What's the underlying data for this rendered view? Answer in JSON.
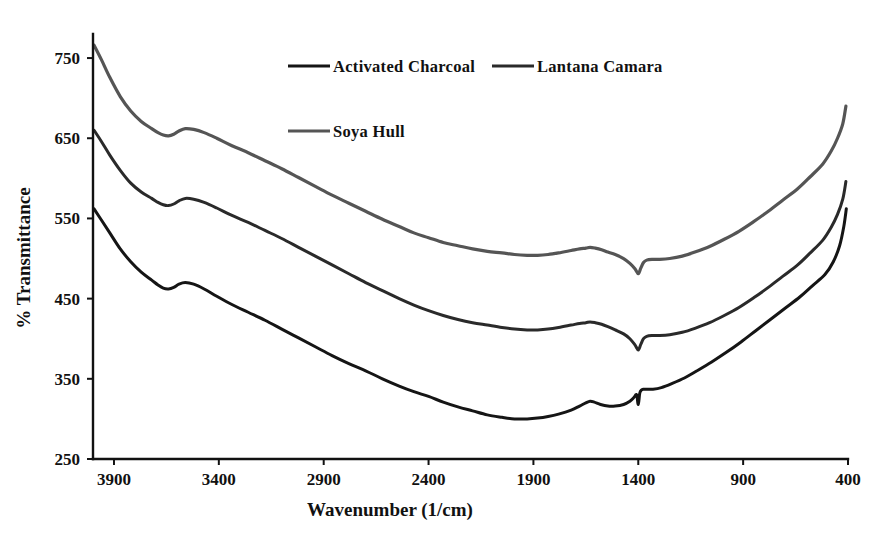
{
  "figure": {
    "width": 895,
    "height": 534,
    "background": "#ffffff"
  },
  "chart_data": {
    "type": "line",
    "title": "",
    "xlabel": "Wavenumber (1/cm)",
    "ylabel": "% Transmittance",
    "xlim": [
      4000,
      400
    ],
    "ylim": [
      250,
      780
    ],
    "x_ticks": [
      3900,
      3400,
      2900,
      2400,
      1900,
      1400,
      900,
      400
    ],
    "y_ticks": [
      250,
      350,
      450,
      550,
      650,
      750
    ],
    "x_reversed": true,
    "grid": false,
    "legend_position": "top-center",
    "series": [
      {
        "name": "Activated Charcoal",
        "color": "#151515",
        "width": 3.0,
        "x": [
          3995,
          3960,
          3920,
          3870,
          3820,
          3770,
          3720,
          3690,
          3665,
          3640,
          3615,
          3590,
          3560,
          3520,
          3470,
          3410,
          3340,
          3260,
          3180,
          3100,
          3020,
          2940,
          2860,
          2780,
          2700,
          2620,
          2540,
          2470,
          2400,
          2330,
          2260,
          2190,
          2120,
          2050,
          1990,
          1930,
          1880,
          1830,
          1780,
          1720,
          1680,
          1650,
          1630,
          1610,
          1580,
          1545,
          1510,
          1470,
          1440,
          1420,
          1408,
          1400,
          1393,
          1385,
          1375,
          1360,
          1330,
          1290,
          1240,
          1180,
          1120,
          1050,
          980,
          910,
          840,
          770,
          700,
          630,
          570,
          510,
          470,
          440,
          420,
          408
        ],
        "y": [
          562,
          548,
          532,
          512,
          496,
          483,
          473,
          467,
          463,
          462,
          464,
          468,
          470,
          468,
          462,
          453,
          443,
          433,
          423,
          412,
          401,
          390,
          379,
          369,
          360,
          350,
          341,
          334,
          328,
          321,
          315,
          310,
          305,
          302,
          300,
          300,
          301,
          303,
          306,
          311,
          316,
          320,
          322,
          321,
          318,
          316,
          316,
          318,
          322,
          327,
          330,
          318,
          332,
          336,
          337,
          337,
          337,
          339,
          344,
          351,
          360,
          371,
          383,
          396,
          410,
          424,
          438,
          452,
          466,
          480,
          496,
          516,
          540,
          562
        ]
      },
      {
        "name": "Lantana Camara",
        "color": "#2a2a2a",
        "width": 3.0,
        "x": [
          3995,
          3960,
          3920,
          3870,
          3820,
          3770,
          3720,
          3690,
          3665,
          3640,
          3615,
          3590,
          3560,
          3520,
          3470,
          3410,
          3340,
          3260,
          3180,
          3100,
          3020,
          2940,
          2860,
          2780,
          2700,
          2620,
          2540,
          2470,
          2400,
          2330,
          2260,
          2190,
          2120,
          2050,
          1990,
          1930,
          1880,
          1830,
          1780,
          1720,
          1680,
          1650,
          1630,
          1605,
          1575,
          1545,
          1510,
          1470,
          1440,
          1415,
          1400,
          1388,
          1375,
          1360,
          1335,
          1300,
          1250,
          1190,
          1130,
          1060,
          990,
          920,
          850,
          780,
          710,
          640,
          580,
          520,
          480,
          450,
          425,
          410
        ],
        "y": [
          660,
          646,
          629,
          610,
          594,
          583,
          575,
          570,
          567,
          566,
          568,
          572,
          575,
          574,
          570,
          563,
          554,
          545,
          535,
          525,
          514,
          503,
          492,
          481,
          470,
          460,
          450,
          442,
          435,
          429,
          424,
          420,
          417,
          414,
          412,
          411,
          411,
          412,
          414,
          417,
          419,
          420,
          421,
          420,
          418,
          415,
          411,
          406,
          400,
          392,
          386,
          393,
          400,
          403,
          404,
          404,
          405,
          408,
          413,
          420,
          429,
          439,
          451,
          464,
          478,
          492,
          507,
          523,
          539,
          555,
          574,
          596
        ]
      },
      {
        "name": "Soya Hull",
        "color": "#555555",
        "width": 3.2,
        "x": [
          3995,
          3960,
          3920,
          3870,
          3820,
          3770,
          3720,
          3690,
          3665,
          3640,
          3615,
          3590,
          3560,
          3520,
          3470,
          3410,
          3340,
          3260,
          3180,
          3100,
          3020,
          2940,
          2860,
          2780,
          2700,
          2620,
          2540,
          2470,
          2400,
          2330,
          2260,
          2190,
          2120,
          2050,
          1990,
          1930,
          1880,
          1830,
          1780,
          1720,
          1680,
          1650,
          1630,
          1605,
          1575,
          1545,
          1510,
          1470,
          1440,
          1415,
          1400,
          1388,
          1375,
          1360,
          1335,
          1300,
          1250,
          1190,
          1130,
          1060,
          990,
          920,
          850,
          780,
          710,
          640,
          580,
          520,
          480,
          450,
          425,
          410
        ],
        "y": [
          766,
          748,
          726,
          702,
          684,
          671,
          662,
          657,
          654,
          653,
          655,
          659,
          662,
          661,
          657,
          650,
          641,
          632,
          622,
          612,
          601,
          590,
          579,
          569,
          559,
          549,
          540,
          532,
          526,
          520,
          516,
          512,
          509,
          507,
          505,
          504,
          504,
          505,
          507,
          510,
          512,
          513,
          514,
          513,
          511,
          508,
          505,
          500,
          494,
          487,
          481,
          488,
          495,
          498,
          499,
          499,
          500,
          503,
          508,
          515,
          524,
          534,
          546,
          559,
          573,
          587,
          602,
          618,
          634,
          650,
          668,
          690
        ]
      }
    ]
  },
  "legend": {
    "entries": [
      {
        "label": "Activated Charcoal",
        "color": "#151515"
      },
      {
        "label": "Lantana Camara",
        "color": "#2a2a2a"
      },
      {
        "label": "Soya Hull",
        "color": "#555555"
      }
    ]
  },
  "axes": {
    "x_title": "Wavenumber (1/cm)",
    "y_title": "% Transmittance",
    "x_tick_labels": [
      "3900",
      "3400",
      "2900",
      "2400",
      "1900",
      "1400",
      "900",
      "400"
    ],
    "y_tick_labels": [
      "750",
      "650",
      "550",
      "450",
      "350",
      "250"
    ]
  }
}
